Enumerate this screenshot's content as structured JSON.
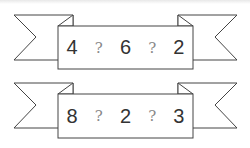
{
  "ribbons": [
    {
      "items": [
        "4",
        "?",
        "6",
        "?",
        "2"
      ]
    },
    {
      "items": [
        "8",
        "?",
        "2",
        "?",
        "3"
      ]
    }
  ],
  "colors": {
    "stroke": "#444444",
    "text": "#333333",
    "question": "#888888"
  }
}
